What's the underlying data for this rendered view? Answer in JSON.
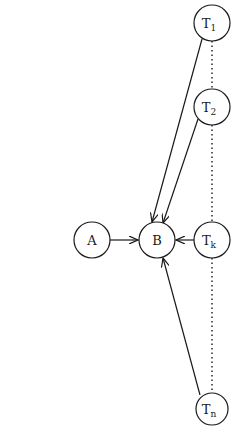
{
  "diagram": {
    "nodes": [
      {
        "id": "A",
        "label": "A",
        "sub": "",
        "cx": 92,
        "cy": 240
      },
      {
        "id": "B",
        "label": "B",
        "sub": "",
        "cx": 157,
        "cy": 240
      },
      {
        "id": "T1",
        "label": "T",
        "sub": "1",
        "cx": 212,
        "cy": 23
      },
      {
        "id": "T2",
        "label": "T",
        "sub": "2",
        "cx": 212,
        "cy": 107
      },
      {
        "id": "Tk",
        "label": "T",
        "sub": "k",
        "cx": 212,
        "cy": 240
      },
      {
        "id": "Tn",
        "label": "T",
        "sub": "n",
        "cx": 212,
        "cy": 409
      }
    ],
    "edges": [
      {
        "from": "A",
        "to": "B",
        "style": "arrow"
      },
      {
        "from": "T1",
        "to": "B",
        "style": "arrow"
      },
      {
        "from": "T2",
        "to": "B",
        "style": "arrow"
      },
      {
        "from": "Tk",
        "to": "B",
        "style": "arrow"
      },
      {
        "from": "Tn",
        "to": "B",
        "style": "arrow"
      },
      {
        "from": "T1",
        "to": "Tn",
        "style": "dotted"
      }
    ],
    "colors": {
      "stroke": "#1a1a1a",
      "background": "#ffffff"
    }
  }
}
